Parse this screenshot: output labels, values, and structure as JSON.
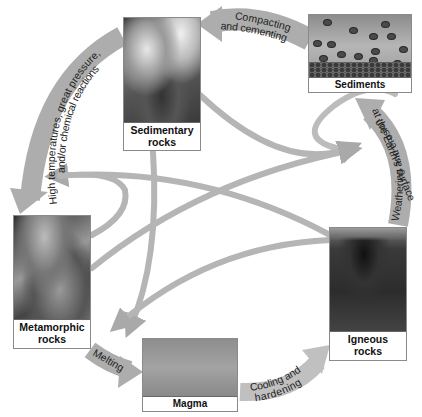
{
  "diagram": {
    "colors": {
      "arrow": "#a9a9a9",
      "arrow_light": "#c4c4c4",
      "label_text": "#111111",
      "background": "#ffffff"
    },
    "nodes": {
      "sedimentary": {
        "label_line1": "Sedimentary",
        "label_line2": "rocks"
      },
      "sediments": {
        "label": "Sediments"
      },
      "metamorphic": {
        "label_line1": "Metamorphic",
        "label_line2": "rocks"
      },
      "igneous": {
        "label_line1": "Igneous",
        "label_line2": "rocks"
      },
      "magma": {
        "label": "Magma"
      }
    },
    "processes": {
      "compacting": {
        "line1": "Compacting",
        "line2": "and cementing",
        "from": "Sediments",
        "to": "Sedimentary rocks"
      },
      "metamorphism": {
        "line1": "High temperatures, great pressure,",
        "line2": "and/or chemical reactions",
        "from": "Sedimentary rocks",
        "to": "Metamorphic rocks"
      },
      "melting": {
        "line1": "Melting",
        "from": "Metamorphic rocks",
        "to": "Magma"
      },
      "cooling": {
        "line1": "Cooling and",
        "line2": "hardening",
        "from": "Magma",
        "to": "Igneous rocks"
      },
      "weathering": {
        "line1": "Weathering and erosion",
        "line2": "at the Earth's surface",
        "from": "Igneous rocks",
        "to": "Sediments"
      }
    },
    "cross_arrows": [
      {
        "from": "Sedimentary rocks",
        "to": "Sediments"
      },
      {
        "from": "Sedimentary rocks",
        "to": "Magma"
      },
      {
        "from": "Metamorphic rocks",
        "to": "Sediments"
      },
      {
        "from": "Igneous rocks",
        "to": "Metamorphic rocks"
      },
      {
        "from": "Igneous rocks",
        "to": "Magma"
      }
    ]
  }
}
